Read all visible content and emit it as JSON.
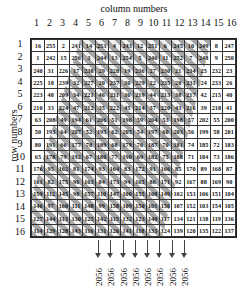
{
  "labels": {
    "column_title": "column numbers",
    "row_title": "row numbers"
  },
  "column_numbers": [
    "1",
    "2",
    "3",
    "4",
    "5",
    "6",
    "7",
    "8",
    "9",
    "10",
    "11",
    "12",
    "13",
    "14",
    "15",
    "16"
  ],
  "row_numbers": [
    "1",
    "2",
    "3",
    "4",
    "5",
    "6",
    "7",
    "8",
    "9",
    "10",
    "11",
    "12",
    "13",
    "14",
    "15",
    "16"
  ],
  "grid": [
    [
      "16",
      "255",
      "2",
      "241",
      "14",
      "253",
      "4",
      "243",
      "12",
      "251",
      "6",
      "245",
      "10",
      "249",
      "8",
      "247"
    ],
    [
      "1",
      "242",
      "15",
      "256",
      "3",
      "244",
      "13",
      "254",
      "5",
      "246",
      "11",
      "252",
      "7",
      "248",
      "9",
      "250"
    ],
    [
      "240",
      "31",
      "226",
      "17",
      "238",
      "29",
      "228",
      "19",
      "236",
      "27",
      "230",
      "21",
      "234",
      "25",
      "232",
      "23"
    ],
    [
      "225",
      "18",
      "239",
      "32",
      "227",
      "20",
      "237",
      "30",
      "229",
      "22",
      "235",
      "28",
      "231",
      "24",
      "233",
      "26"
    ],
    [
      "223",
      "48",
      "209",
      "34",
      "221",
      "46",
      "211",
      "36",
      "219",
      "44",
      "213",
      "38",
      "217",
      "42",
      "215",
      "40"
    ],
    [
      "210",
      "33",
      "224",
      "47",
      "212",
      "35",
      "222",
      "45",
      "214",
      "37",
      "220",
      "43",
      "216",
      "39",
      "218",
      "41"
    ],
    [
      "63",
      "208",
      "49",
      "194",
      "61",
      "206",
      "51",
      "196",
      "59",
      "204",
      "53",
      "198",
      "57",
      "202",
      "55",
      "200"
    ],
    [
      "50",
      "193",
      "64",
      "207",
      "52",
      "195",
      "62",
      "205",
      "54",
      "197",
      "60",
      "203",
      "56",
      "199",
      "58",
      "201"
    ],
    [
      "80",
      "191",
      "66",
      "177",
      "78",
      "189",
      "68",
      "179",
      "76",
      "187",
      "70",
      "181",
      "74",
      "185",
      "72",
      "183"
    ],
    [
      "65",
      "178",
      "79",
      "192",
      "67",
      "180",
      "77",
      "190",
      "69",
      "182",
      "75",
      "188",
      "71",
      "184",
      "73",
      "186"
    ],
    [
      "176",
      "95",
      "162",
      "81",
      "174",
      "93",
      "164",
      "83",
      "172",
      "91",
      "166",
      "85",
      "170",
      "89",
      "168",
      "87"
    ],
    [
      "161",
      "82",
      "175",
      "96",
      "163",
      "84",
      "173",
      "94",
      "165",
      "86",
      "171",
      "92",
      "167",
      "88",
      "169",
      "90"
    ],
    [
      "159",
      "112",
      "145",
      "98",
      "157",
      "110",
      "147",
      "100",
      "155",
      "108",
      "149",
      "102",
      "153",
      "106",
      "151",
      "104"
    ],
    [
      "146",
      "97",
      "160",
      "111",
      "148",
      "99",
      "158",
      "109",
      "150",
      "101",
      "156",
      "107",
      "152",
      "103",
      "154",
      "105"
    ],
    [
      "127",
      "144",
      "113",
      "130",
      "125",
      "142",
      "115",
      "132",
      "123",
      "140",
      "117",
      "134",
      "121",
      "138",
      "119",
      "136"
    ],
    [
      "114",
      "129",
      "128",
      "143",
      "116",
      "131",
      "126",
      "141",
      "118",
      "133",
      "124",
      "139",
      "120",
      "135",
      "122",
      "137"
    ]
  ],
  "outputs": [
    "2056",
    "2056",
    "2056",
    "2056",
    "2056",
    "2056",
    "2056",
    "2056"
  ],
  "colors": {
    "shade": "#969696",
    "border": "#333333"
  }
}
